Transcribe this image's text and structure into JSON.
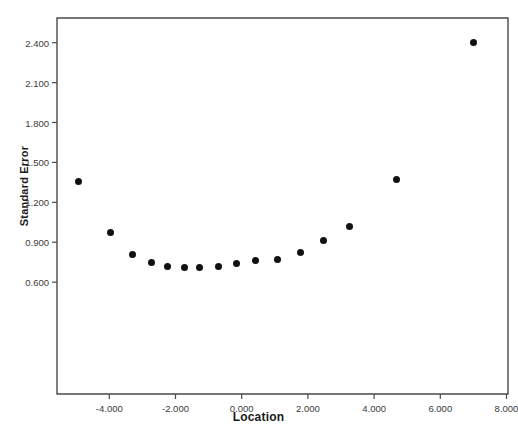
{
  "chart_data": {
    "type": "scatter",
    "title": "",
    "xlabel": "Location",
    "ylabel": "Standard Error",
    "xlim": [
      -5.95,
      8.65
    ],
    "ylim": [
      0.36,
      2.53
    ],
    "grid": false,
    "legend": null,
    "xticks": [
      -4.0,
      -2.0,
      0.0,
      2.0,
      4.0,
      6.0,
      8.0
    ],
    "xtick_labels": [
      "-4.000",
      "-2.000",
      "0.000",
      "2.000",
      "4.000",
      "6.000",
      "8.000"
    ],
    "yticks": [
      0.6,
      0.9,
      1.2,
      1.5,
      1.8,
      2.1,
      2.4
    ],
    "ytick_labels": [
      "0.600",
      "0.900",
      "1.200",
      "1.500",
      "1.800",
      "2.100",
      "2.400"
    ],
    "marker": "filled-circle",
    "marker_color": "#111111",
    "marker_size": 7,
    "x": [
      -4.92,
      -3.95,
      -3.31,
      -2.71,
      -2.23,
      -1.74,
      -1.26,
      -0.71,
      -0.17,
      0.43,
      1.07,
      1.79,
      2.46,
      3.27,
      4.69,
      7.0
    ],
    "y": [
      1.36,
      0.97,
      0.81,
      0.75,
      0.72,
      0.71,
      0.71,
      0.72,
      0.74,
      0.76,
      0.77,
      0.82,
      0.91,
      1.02,
      1.37,
      2.4
    ],
    "points": [
      {
        "x": -4.92,
        "y": 1.36
      },
      {
        "x": -3.95,
        "y": 0.97
      },
      {
        "x": -3.31,
        "y": 0.81
      },
      {
        "x": -2.71,
        "y": 0.75
      },
      {
        "x": -2.23,
        "y": 0.72
      },
      {
        "x": -1.74,
        "y": 0.71
      },
      {
        "x": -1.26,
        "y": 0.71
      },
      {
        "x": -0.71,
        "y": 0.72
      },
      {
        "x": -0.17,
        "y": 0.74
      },
      {
        "x": 0.43,
        "y": 0.76
      },
      {
        "x": 1.07,
        "y": 0.77
      },
      {
        "x": 1.79,
        "y": 0.82
      },
      {
        "x": 2.46,
        "y": 0.91
      },
      {
        "x": 3.27,
        "y": 1.02
      },
      {
        "x": 4.69,
        "y": 1.37
      },
      {
        "x": 7.0,
        "y": 2.4
      }
    ]
  },
  "plot": {
    "frame_color": "#4a4a4a",
    "background": "#ffffff",
    "axes_px": {
      "left": 57,
      "right": 508,
      "top": 18,
      "bottom": 394,
      "x_origin_px": 241.7,
      "x_scale_px_per_unit": 33.1,
      "y_ref_value": 2.4,
      "y_ref_px": 42.7,
      "y_scale_px_per_unit": 133.0
    }
  }
}
